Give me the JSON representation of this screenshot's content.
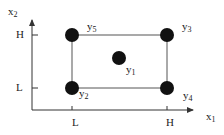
{
  "axes": {
    "x_label": "x",
    "x_label_sub": "1",
    "y_label": "x",
    "y_label_sub": "2",
    "x_ticks": [
      {
        "label": "L",
        "x": 72
      },
      {
        "label": "H",
        "x": 167
      }
    ],
    "y_ticks": [
      {
        "label": "H",
        "y": 35
      },
      {
        "label": "L",
        "y": 88
      }
    ]
  },
  "points": [
    {
      "name": "y",
      "sub": "1",
      "position": "center",
      "x": 119,
      "y": 58
    },
    {
      "name": "y",
      "sub": "2",
      "position": "low-low",
      "x": 72,
      "y": 88
    },
    {
      "name": "y",
      "sub": "3",
      "position": "high-high",
      "x": 167,
      "y": 35
    },
    {
      "name": "y",
      "sub": "4",
      "position": "high-low",
      "x": 167,
      "y": 88
    },
    {
      "name": "y",
      "sub": "5",
      "position": "low-high",
      "x": 72,
      "y": 35
    }
  ],
  "colors": {
    "axis": "#333333",
    "rectangle": "#555555",
    "point": "#111111",
    "text": "#222222"
  }
}
